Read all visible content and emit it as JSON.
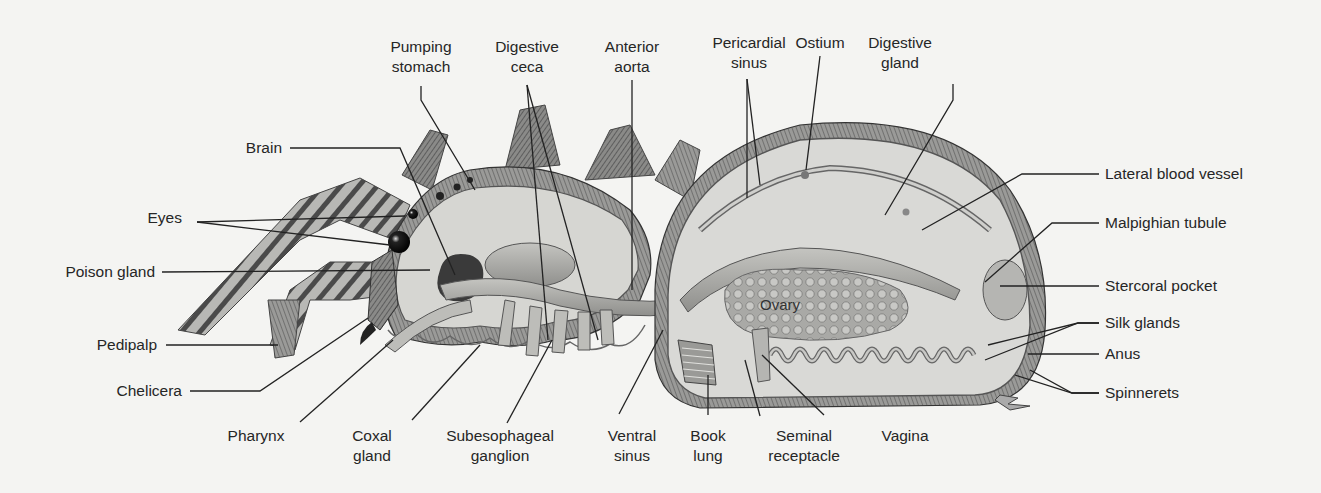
{
  "figure": {
    "colors": {
      "background": "#f4f4f2",
      "ink": "#262626",
      "body_fill": "#d6d6d2",
      "hair": "#5a5a5a"
    }
  },
  "labels": {
    "pumping_stomach": {
      "line1": "Pumping",
      "line2": "stomach"
    },
    "digestive_ceca": {
      "line1": "Digestive",
      "line2": "ceca"
    },
    "anterior_aorta": {
      "line1": "Anterior",
      "line2": "aorta"
    },
    "pericardial_sinus": {
      "line1": "Pericardial",
      "line2": "sinus"
    },
    "ostium": {
      "line1": "Ostium"
    },
    "digestive_gland": {
      "line1": "Digestive",
      "line2": "gland"
    },
    "brain": {
      "line1": "Brain"
    },
    "eyes": {
      "line1": "Eyes"
    },
    "poison_gland": {
      "line1": "Poison gland"
    },
    "pedipalp": {
      "line1": "Pedipalp"
    },
    "chelicera": {
      "line1": "Chelicera"
    },
    "pharynx": {
      "line1": "Pharynx"
    },
    "coxal_gland": {
      "line1": "Coxal",
      "line2": "gland"
    },
    "subesophageal_ganglion": {
      "line1": "Subesophageal",
      "line2": "ganglion"
    },
    "ventral_sinus": {
      "line1": "Ventral",
      "line2": "sinus"
    },
    "book_lung": {
      "line1": "Book",
      "line2": "lung"
    },
    "seminal_receptacle": {
      "line1": "Seminal",
      "line2": "receptacle"
    },
    "vagina": {
      "line1": "Vagina"
    },
    "lateral_blood_vessel": {
      "line1": "Lateral blood vessel"
    },
    "malpighian_tubule": {
      "line1": "Malpighian tubule"
    },
    "stercoral_pocket": {
      "line1": "Stercoral pocket"
    },
    "silk_glands": {
      "line1": "Silk glands"
    },
    "anus": {
      "line1": "Anus"
    },
    "spinnerets": {
      "line1": "Spinnerets"
    },
    "ovary": {
      "line1": "Ovary"
    }
  }
}
